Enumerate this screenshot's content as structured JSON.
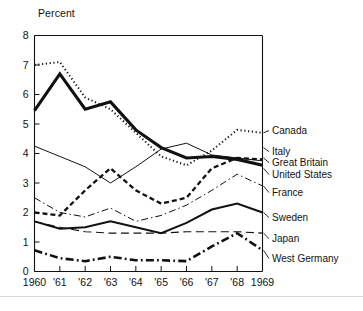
{
  "figure": {
    "axis_unit_label": "Percent",
    "background": "#ffffff",
    "ink_color": "#111111"
  },
  "chart_data": {
    "type": "line",
    "title": "",
    "subtitle": "",
    "xlabel": "",
    "ylabel": "Percent",
    "xlim": [
      1960,
      1969
    ],
    "ylim": [
      0,
      8
    ],
    "grid": false,
    "legend_position": "right-inline",
    "x": [
      1960,
      1961,
      1962,
      1963,
      1964,
      1965,
      1966,
      1967,
      1968,
      1969
    ],
    "xtick_labels": [
      "1960",
      "'61",
      "'62",
      "'63",
      "'64",
      "'65",
      "'66",
      "'67",
      "'68",
      "1969"
    ],
    "ytick_labels": [
      "0",
      "1",
      "2",
      "3",
      "4",
      "5",
      "6",
      "7",
      "8"
    ],
    "ytick_values": [
      0,
      1,
      2,
      3,
      4,
      5,
      6,
      7,
      8
    ],
    "series": [
      {
        "name": "Canada",
        "style": "dotted",
        "width": 2.0,
        "values": [
          7.0,
          7.1,
          5.9,
          5.5,
          4.7,
          3.9,
          3.6,
          4.1,
          4.8,
          4.7
        ]
      },
      {
        "name": "Italy",
        "style": "solid-thick",
        "width": 3.0,
        "values": [
          5.45,
          6.7,
          5.5,
          5.75,
          4.8,
          4.2,
          3.85,
          3.9,
          3.8,
          3.6
        ]
      },
      {
        "name": "Great Britain",
        "style": "dashed",
        "width": 2.2,
        "values": [
          2.0,
          1.9,
          2.75,
          3.5,
          2.75,
          2.3,
          2.5,
          3.5,
          3.85,
          3.8
        ]
      },
      {
        "name": "United States",
        "style": "solid-thin",
        "width": 1.0,
        "values": [
          4.25,
          3.9,
          3.55,
          3.0,
          3.55,
          4.15,
          4.35,
          3.95,
          3.85,
          3.75
        ]
      },
      {
        "name": "France",
        "style": "dash-dot-thin",
        "width": 1.0,
        "values": [
          2.5,
          2.0,
          1.85,
          2.15,
          1.7,
          1.9,
          2.25,
          2.75,
          3.3,
          2.9
        ]
      },
      {
        "name": "Sweden",
        "style": "solid-medium",
        "width": 2.0,
        "values": [
          1.7,
          1.45,
          1.5,
          1.7,
          1.5,
          1.3,
          1.65,
          2.1,
          2.3,
          2.0
        ]
      },
      {
        "name": "Japan",
        "style": "long-dash",
        "width": 1.1,
        "values": [
          1.7,
          1.5,
          1.35,
          1.3,
          1.3,
          1.3,
          1.35,
          1.35,
          1.35,
          1.3
        ]
      },
      {
        "name": "West Germany",
        "style": "dash-dot-thick",
        "width": 2.6,
        "values": [
          0.72,
          0.45,
          0.35,
          0.5,
          0.38,
          0.38,
          0.35,
          0.85,
          1.3,
          0.72
        ]
      }
    ],
    "legend_entries": [
      {
        "label": "Canada",
        "anchor_value": 4.7
      },
      {
        "label": "Italy",
        "anchor_value": 4.2
      },
      {
        "label": "Great Britain",
        "anchor_value": 3.85
      },
      {
        "label": "United States",
        "anchor_value": 3.5
      },
      {
        "label": "France",
        "anchor_value": 2.9
      },
      {
        "label": "Sweden",
        "anchor_value": 2.0
      },
      {
        "label": "Japan",
        "anchor_value": 1.3
      },
      {
        "label": "West Germany",
        "anchor_value": 0.72
      }
    ]
  }
}
